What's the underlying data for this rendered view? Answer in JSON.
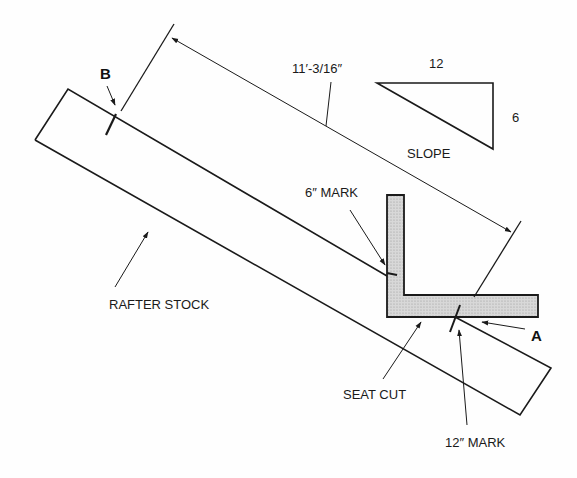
{
  "diagram": {
    "labels": {
      "point_b": "B",
      "point_a": "A",
      "dimension": "11′-3/16″",
      "slope_run": "12",
      "slope_rise": "6",
      "slope": "SLOPE",
      "six_inch_mark": "6″ MARK",
      "rafter_stock": "RAFTER STOCK",
      "seat_cut": "SEAT CUT",
      "twelve_inch_mark": "12″ MARK"
    },
    "colors": {
      "line": "#1a1a1a",
      "square_fill": "#cfcfcf",
      "background": "#fefefe"
    }
  }
}
